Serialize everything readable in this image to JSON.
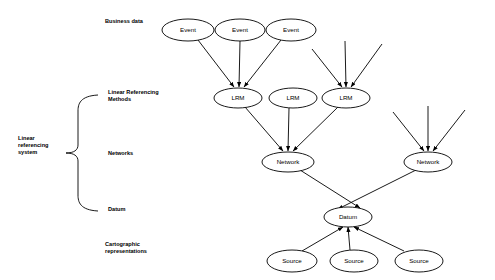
{
  "diagram": {
    "colors": {
      "stroke": "#000000",
      "fill": "#ffffff",
      "background": "#ffffff"
    },
    "tier_labels": [
      {
        "id": "business-data",
        "text": "Business data",
        "x": 105,
        "y": 23
      },
      {
        "id": "linear-referencing-methods",
        "line1": "Linear Referencing",
        "line2": "Methods",
        "x": 108,
        "y": 94
      },
      {
        "id": "networks",
        "text": "Networks",
        "x": 108,
        "y": 155
      },
      {
        "id": "datum",
        "text": "Datum",
        "x": 108,
        "y": 211
      },
      {
        "id": "cartographic-representations",
        "line1": "Cartographic",
        "line2": "representations",
        "x": 105,
        "y": 246
      }
    ],
    "group_label": {
      "id": "linear-referencing-system",
      "line1": "Linear",
      "line2": "referencing",
      "line3": "system",
      "x": 18,
      "y": 140
    },
    "nodes": [
      {
        "id": "event-1",
        "label": "Event",
        "cx": 188,
        "cy": 30,
        "rx": 26,
        "ry": 11
      },
      {
        "id": "event-2",
        "label": "Event",
        "cx": 240,
        "cy": 30,
        "rx": 25,
        "ry": 11
      },
      {
        "id": "event-3",
        "label": "Event",
        "cx": 291,
        "cy": 30,
        "rx": 25,
        "ry": 11
      },
      {
        "id": "lrm-1",
        "label": "LRM",
        "cx": 238,
        "cy": 98,
        "rx": 24,
        "ry": 10
      },
      {
        "id": "lrm-2",
        "label": "LRM",
        "cx": 293,
        "cy": 98,
        "rx": 24,
        "ry": 10
      },
      {
        "id": "lrm-3",
        "label": "LRM",
        "cx": 346,
        "cy": 98,
        "rx": 24,
        "ry": 10
      },
      {
        "id": "network-1",
        "label": "Network",
        "cx": 288,
        "cy": 162,
        "rx": 26,
        "ry": 10
      },
      {
        "id": "network-2",
        "label": "Network",
        "cx": 428,
        "cy": 162,
        "rx": 24,
        "ry": 10
      },
      {
        "id": "datum-node",
        "label": "Datum",
        "cx": 348,
        "cy": 217,
        "rx": 24,
        "ry": 10
      },
      {
        "id": "source-1",
        "label": "Source",
        "cx": 292,
        "cy": 261,
        "rx": 25,
        "ry": 11
      },
      {
        "id": "source-2",
        "label": "Source",
        "cx": 354,
        "cy": 261,
        "rx": 24,
        "ry": 11
      },
      {
        "id": "source-3",
        "label": "Source",
        "cx": 419,
        "cy": 261,
        "rx": 24,
        "ry": 11
      }
    ],
    "edges": [
      {
        "id": "edge-event1-lrm1",
        "from": "event-1",
        "to": "lrm-1",
        "x1": 198,
        "y1": 40,
        "x2": 234,
        "y2": 87
      },
      {
        "id": "edge-event2-lrm1",
        "from": "event-2",
        "to": "lrm-1",
        "x1": 240,
        "y1": 41,
        "x2": 239,
        "y2": 87
      },
      {
        "id": "edge-event3-lrm1",
        "from": "event-3",
        "to": "lrm-1",
        "x1": 281,
        "y1": 40,
        "x2": 244,
        "y2": 87
      },
      {
        "id": "edge-implicit-left-lrm3",
        "from": "unlabeled-source",
        "to": "lrm-3",
        "x1": 312,
        "y1": 49,
        "x2": 342,
        "y2": 87
      },
      {
        "id": "edge-implicit-mid-lrm3",
        "from": "unlabeled-source",
        "to": "lrm-3",
        "x1": 345,
        "y1": 41,
        "x2": 346,
        "y2": 87
      },
      {
        "id": "edge-implicit-right-lrm3",
        "from": "unlabeled-source",
        "to": "lrm-3",
        "x1": 382,
        "y1": 44,
        "x2": 351,
        "y2": 87
      },
      {
        "id": "edge-lrm1-network1",
        "from": "lrm-1",
        "to": "network-1",
        "x1": 245,
        "y1": 107,
        "x2": 283,
        "y2": 151
      },
      {
        "id": "edge-lrm2-network1",
        "from": "lrm-2",
        "to": "network-1",
        "x1": 289,
        "y1": 108,
        "x2": 288,
        "y2": 151
      },
      {
        "id": "edge-lrm3-network1",
        "from": "lrm-3",
        "to": "network-1",
        "x1": 338,
        "y1": 107,
        "x2": 293,
        "y2": 151
      },
      {
        "id": "edge-implicit-left-network2",
        "from": "unlabeled-source",
        "to": "network-2",
        "x1": 393,
        "y1": 112,
        "x2": 424,
        "y2": 151
      },
      {
        "id": "edge-implicit-mid-network2",
        "from": "unlabeled-source",
        "to": "network-2",
        "x1": 428,
        "y1": 106,
        "x2": 428,
        "y2": 151
      },
      {
        "id": "edge-implicit-right-network2",
        "from": "unlabeled-source",
        "to": "network-2",
        "x1": 465,
        "y1": 110,
        "x2": 433,
        "y2": 151
      },
      {
        "id": "edge-network1-datum",
        "from": "network-1",
        "to": "datum-node",
        "x1": 300,
        "y1": 170,
        "x2": 360,
        "y2": 208
      },
      {
        "id": "edge-network2-datum",
        "from": "network-2",
        "to": "datum-node",
        "x1": 416,
        "y1": 170,
        "x2": 338,
        "y2": 209
      },
      {
        "id": "edge-source1-datum",
        "from": "source-1",
        "to": "datum-node",
        "x1": 302,
        "y1": 251,
        "x2": 343,
        "y2": 227
      },
      {
        "id": "edge-source2-datum",
        "from": "source-2",
        "to": "datum-node",
        "x1": 350,
        "y1": 250,
        "x2": 348,
        "y2": 227
      },
      {
        "id": "edge-source3-datum",
        "from": "source-3",
        "to": "datum-node",
        "x1": 404,
        "y1": 251,
        "x2": 354,
        "y2": 227
      }
    ],
    "brace": {
      "id": "linear-referencing-system-brace",
      "top_y": 95,
      "bottom_y": 211,
      "mid_y": 153,
      "spine_x": 78,
      "tip_x": 66,
      "arm_x": 98
    }
  }
}
